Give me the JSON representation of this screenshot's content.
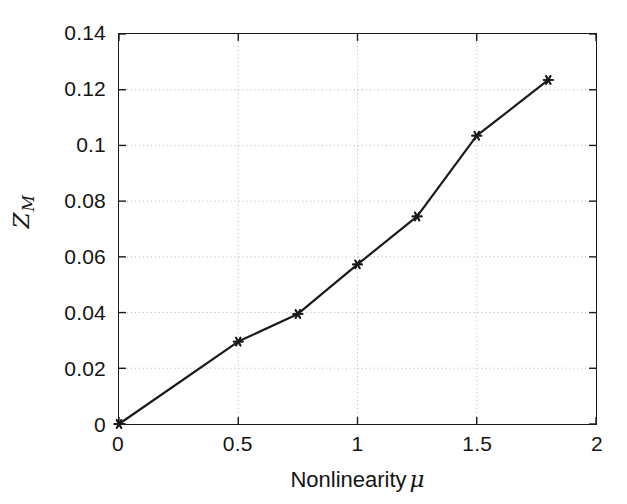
{
  "chart_data": {
    "type": "line",
    "title": "",
    "xlabel": "Nonlinearity μ",
    "ylabel": "Z_M",
    "ylabel_base": "Z",
    "ylabel_sub": "M",
    "xlim": [
      0,
      2
    ],
    "ylim": [
      0,
      0.14
    ],
    "grid": true,
    "legend": null,
    "marker": "asterisk",
    "line_color": "#1a1a1a",
    "grid_color": "#b4b4b4",
    "axis_color": "#1a1a1a",
    "background_color": "#ffffff",
    "xticks": [
      0,
      0.5,
      1,
      1.5,
      2
    ],
    "xtick_labels": [
      "0",
      "0.5",
      "1",
      "1.5",
      "2"
    ],
    "yticks": [
      0,
      0.02,
      0.04,
      0.06,
      0.08,
      0.1,
      0.12,
      0.14
    ],
    "ytick_labels": [
      "0",
      "0.02",
      "0.04",
      "0.06",
      "0.08",
      "0.1",
      "0.12",
      "0.14"
    ],
    "series": [
      {
        "name": "Z_M vs mu",
        "x": [
          0,
          0.5,
          0.75,
          1.0,
          1.25,
          1.5,
          1.8
        ],
        "values": [
          0.0,
          0.0296,
          0.0395,
          0.0573,
          0.0745,
          0.1035,
          0.1235
        ]
      }
    ]
  }
}
